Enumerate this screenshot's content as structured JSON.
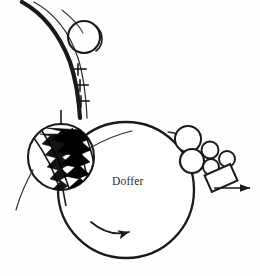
{
  "diagram": {
    "title": "Doffer",
    "type": "technical-line-drawing",
    "background_color": "#fefefe",
    "line_color": "#1a1a1a",
    "fill_color": "#000000",
    "labels": [
      {
        "id": "doffer",
        "text": "Doffer",
        "x": 112,
        "y": 175,
        "color": "#2b2b2b"
      }
    ],
    "components": {
      "doffer_cylinder": {
        "name": "Doffer",
        "shape": "circle",
        "cx": 126,
        "cy": 190,
        "r": 69,
        "stroke_width": 2.2
      },
      "stripper_roller": {
        "name": "Stripper / comb roller",
        "shape": "circle-with-sawtooth-clothing",
        "cx": 61,
        "cy": 157,
        "r": 34,
        "stroke_width": 2.0
      },
      "top_roller": {
        "name": "Guide roller",
        "shape": "circle",
        "cx": 84,
        "cy": 37,
        "r": 16,
        "stroke_width": 2.0
      },
      "calender_rollers": [
        {
          "name": "calender-roller-1",
          "cx": 188,
          "cy": 139,
          "r": 13
        },
        {
          "name": "calender-roller-2",
          "cx": 192,
          "cy": 160,
          "r": 12
        },
        {
          "name": "calender-roller-3",
          "cx": 210,
          "cy": 150,
          "r": 8
        },
        {
          "name": "calender-roller-4",
          "cx": 212,
          "cy": 165,
          "r": 8
        },
        {
          "name": "calender-roller-5",
          "cx": 226,
          "cy": 158,
          "r": 8
        }
      ],
      "trumpet": {
        "name": "Trumpet / coiler funnel",
        "shape": "tilted-rectangle",
        "cx": 222,
        "cy": 177,
        "width": 26,
        "height": 17,
        "rotation_deg": -22
      },
      "web_path": {
        "name": "Web / sliver band",
        "description": "thick curved band entering from top-left passing over the guide roller"
      },
      "clearer_teeth": {
        "name": "Clearer teeth",
        "count": 3,
        "positions": [
          {
            "x": 75,
            "y": 72
          },
          {
            "x": 78,
            "y": 87
          },
          {
            "x": 79,
            "y": 102
          }
        ]
      }
    },
    "arrows": [
      {
        "id": "rotation-arrow",
        "name": "doffer-rotation-arrow",
        "type": "curved",
        "direction": "clockwise-right",
        "description": "curved arrow inside doffer indicating rotation"
      },
      {
        "id": "delivery-arrow",
        "name": "sliver-delivery-arrow",
        "type": "straight",
        "direction": "right",
        "x1": 216,
        "y1": 188,
        "x2": 252,
        "y2": 188
      }
    ]
  }
}
